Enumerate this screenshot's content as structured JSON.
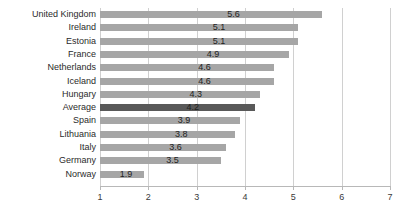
{
  "chart_data": {
    "type": "bar",
    "orientation": "horizontal",
    "title": "",
    "xlabel": "",
    "ylabel": "",
    "xlim": [
      1,
      7
    ],
    "xticks": [
      1,
      2,
      3,
      4,
      5,
      6,
      7
    ],
    "xtick_labels": [
      "1",
      "2",
      "3",
      "4",
      "5",
      "6",
      "7"
    ],
    "grid": true,
    "grid_axis": "x",
    "legend": false,
    "bar_color": "#a6a6a6",
    "highlight_color": "#595959",
    "highlight_category": "Average",
    "categories": [
      "United Kingdom",
      "Ireland",
      "Estonia",
      "France",
      "Netherlands",
      "Iceland",
      "Hungary",
      "Average",
      "Spain",
      "Lithuania",
      "Italy",
      "Germany",
      "Norway"
    ],
    "values": [
      5.6,
      5.1,
      5.1,
      4.9,
      4.6,
      4.6,
      4.3,
      4.2,
      3.9,
      3.8,
      3.6,
      3.5,
      1.9
    ],
    "data_labels": [
      "5.6",
      "5.1",
      "5.1",
      "4.9",
      "4.6",
      "4.6",
      "4.3",
      "4.2",
      "3.9",
      "3.8",
      "3.6",
      "3.5",
      "1.9"
    ]
  }
}
